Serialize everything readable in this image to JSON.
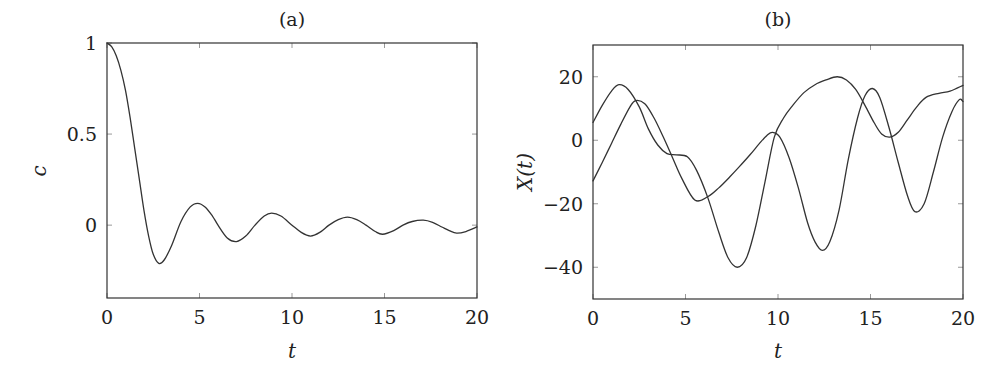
{
  "chart_data": [
    {
      "type": "line",
      "title": "(a)",
      "xlabel": "t",
      "ylabel": "c",
      "xlim": [
        0,
        20
      ],
      "ylim": [
        -0.4,
        1
      ],
      "xticks": [
        0,
        5,
        10,
        15,
        20
      ],
      "yticks": [
        0,
        0.5,
        1
      ],
      "xtick_labels": [
        "0",
        "5",
        "10",
        "15",
        "20"
      ],
      "ytick_labels": [
        "0",
        "0.5",
        "1"
      ],
      "grid": false,
      "legend": null,
      "series": [
        {
          "name": "c(t)",
          "x": [
            0,
            0.25,
            0.5,
            0.75,
            1,
            1.25,
            1.5,
            1.75,
            2,
            2.25,
            2.5,
            2.8,
            3.1,
            3.5,
            4,
            4.5,
            4.9,
            5.3,
            5.7,
            6,
            6.5,
            7,
            7.5,
            8,
            8.5,
            8.9,
            9.4,
            10,
            10.5,
            11,
            11.5,
            12,
            12.5,
            13,
            13.5,
            14,
            14.5,
            14.9,
            15.5,
            16,
            16.5,
            17.1,
            17.6,
            18.1,
            18.5,
            18.9,
            19.4,
            20
          ],
          "y": [
            1,
            0.98,
            0.93,
            0.85,
            0.74,
            0.59,
            0.42,
            0.25,
            0.08,
            -0.06,
            -0.16,
            -0.21,
            -0.19,
            -0.11,
            0.02,
            0.1,
            0.12,
            0.1,
            0.05,
            0.0,
            -0.07,
            -0.09,
            -0.06,
            0.0,
            0.05,
            0.066,
            0.05,
            0.0,
            -0.04,
            -0.06,
            -0.04,
            0.0,
            0.03,
            0.044,
            0.03,
            0.0,
            -0.035,
            -0.05,
            -0.03,
            0.0,
            0.02,
            0.027,
            0.015,
            -0.01,
            -0.03,
            -0.044,
            -0.035,
            -0.01
          ]
        }
      ]
    },
    {
      "type": "line",
      "title": "(b)",
      "xlabel": "t",
      "ylabel": "X(t)",
      "xlim": [
        0,
        20
      ],
      "ylim": [
        -50,
        30
      ],
      "xticks": [
        0,
        5,
        10,
        15,
        20
      ],
      "yticks": [
        -40,
        -20,
        0,
        20
      ],
      "xtick_labels": [
        "0",
        "5",
        "10",
        "15",
        "20"
      ],
      "ytick_labels": [
        "−40",
        "−20",
        "0",
        "20"
      ],
      "grid": false,
      "legend": null,
      "series": [
        {
          "name": "trajectory 1",
          "x": [
            0,
            0.5,
            1,
            1.4,
            1.9,
            2.5,
            3,
            3.5,
            4,
            4.5,
            5.1,
            5.6,
            6.2,
            6.8,
            7.3,
            7.8,
            8.3,
            8.8,
            9.3,
            9.8,
            10.3,
            10.8,
            11.4,
            12,
            12.6,
            13.2,
            13.7,
            14.2,
            14.7,
            15.2,
            15.6,
            16.05,
            16.5,
            17,
            17.5,
            18,
            18.7,
            19.3,
            20
          ],
          "y": [
            5.6,
            11,
            15.5,
            17.5,
            16,
            10.5,
            3.5,
            -1.5,
            -4.2,
            -4.6,
            -5.2,
            -9.5,
            -18,
            -29,
            -37,
            -40,
            -37,
            -27,
            -13,
            1,
            7,
            11,
            15,
            17.5,
            19,
            20,
            19,
            16,
            11,
            5.5,
            2,
            1,
            2.5,
            6.5,
            10.5,
            13.5,
            14.8,
            15.5,
            17.3
          ]
        },
        {
          "name": "trajectory 2",
          "x": [
            0,
            0.5,
            1,
            1.5,
            2,
            2.3,
            2.8,
            3.3,
            3.8,
            4.3,
            4.8,
            5.5,
            6.2,
            6.8,
            7.4,
            7.9,
            8.5,
            9,
            9.4,
            9.7,
            10.1,
            10.6,
            11.1,
            11.6,
            12,
            12.4,
            12.8,
            13.3,
            13.8,
            14.3,
            14.7,
            15.1,
            15.5,
            16,
            16.5,
            17,
            17.4,
            17.9,
            18.4,
            18.9,
            19.4,
            19.8,
            20
          ],
          "y": [
            -12.8,
            -7,
            -1,
            5,
            10.5,
            12.5,
            11.5,
            7,
            1,
            -5.5,
            -12,
            -18.8,
            -17.8,
            -15,
            -11.5,
            -8.4,
            -4.5,
            -1,
            1.5,
            2.5,
            1,
            -5.5,
            -15,
            -26,
            -32,
            -34.7,
            -32,
            -22,
            -6,
            7,
            14,
            16.3,
            13.5,
            4,
            -7,
            -17.5,
            -22.5,
            -20,
            -10,
            1,
            9,
            12.8,
            12.2
          ]
        }
      ]
    }
  ],
  "panels": {
    "a": {
      "title": "(a)",
      "xlabel": "t",
      "ylabel": "c"
    },
    "b": {
      "title": "(b)",
      "xlabel": "t",
      "ylabel": "X(t)"
    }
  },
  "style": {
    "line_color": "#333333",
    "frame_color": "#333333",
    "tick_color": "#999999",
    "background": "#ffffff"
  }
}
